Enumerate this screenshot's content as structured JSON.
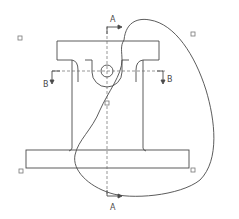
{
  "drawing": {
    "type": "engineering-cad-drawing",
    "colors": {
      "outline": "#4a4a4a",
      "centerline": "#6a6a6a",
      "grip": "#777777",
      "background": "#ffffff"
    },
    "section_labels": {
      "a_top": "A",
      "a_bottom": "A",
      "b_left": "B",
      "b_right": "B"
    },
    "parts": [
      "top-flange",
      "central-column",
      "bottom-flange",
      "pin-hole",
      "spline-boundary"
    ],
    "grips": [
      {
        "x": 20,
        "y": 38
      },
      {
        "x": 193,
        "y": 34
      },
      {
        "x": 21,
        "y": 171
      },
      {
        "x": 193,
        "y": 170
      },
      {
        "x": 107,
        "y": 103
      }
    ]
  }
}
